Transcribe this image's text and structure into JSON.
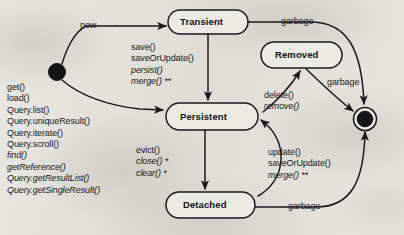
{
  "diagram": {
    "type": "state-machine",
    "stroke_color": "#1a1a1d",
    "background_color": "#e6e4df",
    "text_color": "#17171a"
  },
  "states": [
    {
      "id": "initial",
      "name": "initial-state",
      "label": "",
      "shape": "filled-circle"
    },
    {
      "id": "transient",
      "name": "state-transient",
      "label": "Transient",
      "shape": "rounded-rect"
    },
    {
      "id": "persistent",
      "name": "state-persistent",
      "label": "Persistent",
      "shape": "rounded-rect"
    },
    {
      "id": "detached",
      "name": "state-detached",
      "label": "Detached",
      "shape": "rounded-rect"
    },
    {
      "id": "removed",
      "name": "state-removed",
      "label": "Removed",
      "shape": "rounded-rect"
    },
    {
      "id": "final",
      "name": "final-state",
      "label": "",
      "shape": "bullseye"
    }
  ],
  "transitions": {
    "new": "new",
    "garbage_top": "garbage",
    "garbage_mid": "garbage",
    "garbage_bottom": "garbage",
    "save_group": [
      {
        "text": "save()",
        "italic": false
      },
      {
        "text": "saveOrUpdate()",
        "italic": false
      },
      {
        "text": "persist()",
        "italic": true
      },
      {
        "text": "merge() **",
        "italic": true
      }
    ],
    "load_group": [
      {
        "text": "get()",
        "italic": false
      },
      {
        "text": "load()",
        "italic": false
      },
      {
        "text": "Query.list()",
        "italic": false
      },
      {
        "text": "Query.uniqueResult()",
        "italic": false
      },
      {
        "text": "Query.iterate()",
        "italic": false
      },
      {
        "text": "Query.scroll()",
        "italic": false
      },
      {
        "text": "find()",
        "italic": true
      },
      {
        "text": "getReference()",
        "italic": true
      },
      {
        "text": "Query.getResultList()",
        "italic": true
      },
      {
        "text": "Query.getSingleResult()",
        "italic": true
      }
    ],
    "detach_group": [
      {
        "text": "evict()",
        "italic": false
      },
      {
        "text": "close() *",
        "italic": true
      },
      {
        "text": "clear() *",
        "italic": true
      }
    ],
    "delete_group": [
      {
        "text": "delete()",
        "italic": false
      },
      {
        "text": "remove()",
        "italic": true
      }
    ],
    "reattach_group": [
      {
        "text": "update()",
        "italic": false
      },
      {
        "text": "saveOrUpdate()",
        "italic": false
      },
      {
        "text": "merge() **",
        "italic": true
      }
    ]
  }
}
